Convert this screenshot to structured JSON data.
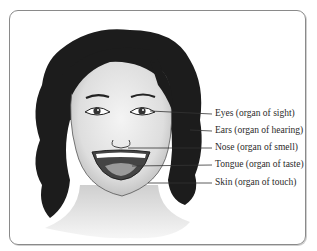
{
  "figure": {
    "labels": [
      {
        "organ": "Eyes",
        "text": "Eyes (organ of sight)"
      },
      {
        "organ": "Ears",
        "text": "Ears (organ of hearing)"
      },
      {
        "organ": "Nose",
        "text": "Nose (organ of smell)"
      },
      {
        "organ": "Tongue",
        "text": "Tongue (organ of taste)"
      },
      {
        "organ": "Skin",
        "text": "Skin (organ of touch)"
      }
    ]
  },
  "colors": {
    "frame": "#8a8a8a",
    "hair": "#1c1c1c",
    "skin": "#e4e4e4",
    "text": "#2a2a2a"
  }
}
